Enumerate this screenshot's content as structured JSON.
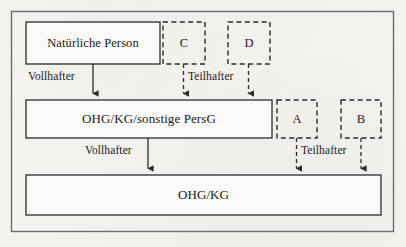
{
  "figure": {
    "type": "flow-diagram",
    "background_color": "#f3f2ef",
    "line_color": "#2b2b2b",
    "text_color": "#1b1b1b"
  },
  "frame": {
    "name": "outer-frame"
  },
  "nodes": {
    "natuerliche_person": {
      "label": "Natürliche Person",
      "style": "solid",
      "x": 26,
      "y": 22,
      "w": 134,
      "h": 42
    },
    "c_box": {
      "label": "C",
      "style": "dashed",
      "x": 163,
      "y": 22,
      "w": 42,
      "h": 42
    },
    "d_box": {
      "label": "D",
      "style": "dashed",
      "x": 228,
      "y": 22,
      "w": 42,
      "h": 42
    },
    "persg": {
      "label": "OHG/KG/sonstige PersG",
      "style": "solid",
      "x": 26,
      "y": 100,
      "w": 246,
      "h": 38
    },
    "a_box": {
      "label": "A",
      "style": "dashed",
      "x": 277,
      "y": 100,
      "w": 40,
      "h": 38
    },
    "b_box": {
      "label": "B",
      "style": "dashed",
      "x": 341,
      "y": 100,
      "w": 40,
      "h": 38
    },
    "ohgkg": {
      "label": "OHG/KG",
      "style": "solid",
      "x": 26,
      "y": 175,
      "w": 355,
      "h": 40
    }
  },
  "edges": [
    {
      "id": "edge-person-to-persg",
      "label": "Vollhafter",
      "style": "solid",
      "from": "natuerliche_person",
      "to": "persg"
    },
    {
      "id": "edge-c-to-persg",
      "label": "Teilhafter",
      "style": "dashed",
      "from": "c_box",
      "to": "persg"
    },
    {
      "id": "edge-d-to-persg",
      "label": "Teilhafter",
      "style": "dashed",
      "from": "d_box",
      "to": "persg"
    },
    {
      "id": "edge-persg-to-ohgkg",
      "label": "Vollhafter",
      "style": "solid",
      "from": "persg",
      "to": "ohgkg"
    },
    {
      "id": "edge-a-to-ohgkg",
      "label": "Teilhafter",
      "style": "dashed",
      "from": "a_box",
      "to": "ohgkg"
    },
    {
      "id": "edge-b-to-ohgkg",
      "label": "Teilhafter",
      "style": "dashed",
      "from": "b_box",
      "to": "ohgkg"
    }
  ],
  "edge_labels": {
    "vollhafter_top": "Vollhafter",
    "teilhafter_top": "Teilhafter",
    "vollhafter_bottom": "Vollhafter",
    "teilhafter_bottom": "Teilhafter"
  }
}
